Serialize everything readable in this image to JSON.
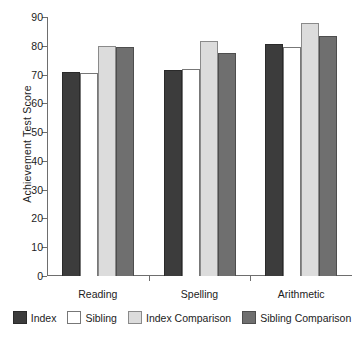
{
  "chart_data": {
    "type": "bar",
    "title": "",
    "xlabel": "",
    "ylabel": "Achievement Test Score",
    "categories": [
      "Reading",
      "Spelling",
      "Arithmetic"
    ],
    "ylim": [
      0,
      90
    ],
    "yticks": [
      0,
      10,
      20,
      30,
      40,
      50,
      60,
      70,
      80,
      90
    ],
    "ytick_labels": [
      "0",
      "10",
      "20",
      "30",
      "40",
      "50",
      "60",
      "70",
      "80",
      "90"
    ],
    "grid": false,
    "legend_position": "bottom",
    "series": [
      {
        "name": "Index",
        "color": "#3c3c3c",
        "values": [
          71.0,
          71.5,
          80.5
        ]
      },
      {
        "name": "Sibling",
        "color": "#ffffff",
        "values": [
          70.5,
          72.0,
          79.5
        ]
      },
      {
        "name": "Index Comparison",
        "color": "#dcdcdc",
        "values": [
          80.0,
          81.5,
          88.0
        ]
      },
      {
        "name": "Sibling Comparison",
        "color": "#6f6f6f",
        "values": [
          79.5,
          77.5,
          83.5
        ]
      }
    ]
  }
}
